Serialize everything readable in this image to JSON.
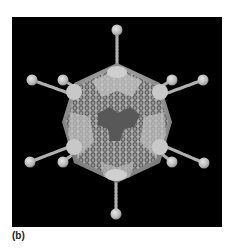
{
  "figure": {
    "panel_label": "(b)",
    "background_color": "#000000",
    "capsid_color": "#bdbdbd",
    "capsid_dark_color": "#555555",
    "fiber_color": "#c8c8c8",
    "fiber_count": 10
  }
}
